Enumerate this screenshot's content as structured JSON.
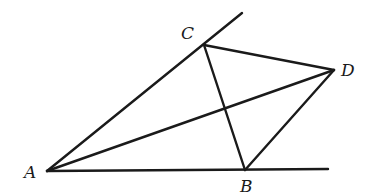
{
  "diagram": {
    "type": "geometry",
    "points": {
      "A": {
        "label": "A",
        "x": 47,
        "y": 171,
        "label_x": 24,
        "label_y": 178
      },
      "B": {
        "label": "B",
        "x": 245,
        "y": 170,
        "label_x": 240,
        "label_y": 192
      },
      "C": {
        "label": "C",
        "x": 204,
        "y": 45,
        "label_x": 181,
        "label_y": 39
      },
      "D": {
        "label": "D",
        "x": 334,
        "y": 70,
        "label_x": 341,
        "label_y": 76
      }
    },
    "rays": [
      {
        "name": "ray-AC",
        "from": "A",
        "through": "C",
        "end_x": 242,
        "end_y": 13
      },
      {
        "name": "ray-AB",
        "from": "A",
        "through": "B",
        "end_x": 328,
        "end_y": 169
      }
    ],
    "segments": [
      {
        "name": "segment-CD",
        "from": "C",
        "to": "D"
      },
      {
        "name": "segment-BD",
        "from": "B",
        "to": "D"
      },
      {
        "name": "segment-CB",
        "from": "C",
        "to": "B"
      },
      {
        "name": "segment-AD",
        "from": "A",
        "to": "D"
      }
    ],
    "stroke_color": "#1a1a1a",
    "background": "#ffffff"
  }
}
